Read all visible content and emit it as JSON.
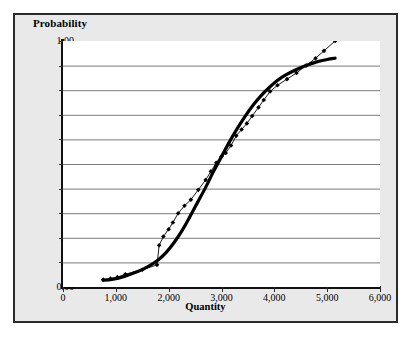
{
  "chart_data": {
    "type": "line",
    "title": "",
    "xlabel": "Quantity",
    "ylabel": "Probability",
    "xlim": [
      0,
      6000
    ],
    "ylim": [
      0.0,
      1.0
    ],
    "grid": true,
    "legend": "none",
    "xticks": [
      0,
      1000,
      2000,
      3000,
      4000,
      5000,
      6000
    ],
    "xtick_labels": [
      "0",
      "1,000",
      "2,000",
      "3,000",
      "4,000",
      "5,000",
      "6,000"
    ],
    "yticks": [
      0.0,
      0.1,
      0.2,
      0.3,
      0.4,
      0.5,
      0.6,
      0.7,
      0.8,
      0.9,
      1.0
    ],
    "ytick_labels": [
      "0.00",
      ".10",
      ".20",
      ".30",
      ".40",
      ".50",
      ".60",
      ".70",
      ".80",
      ".90",
      "1.00"
    ],
    "series": [
      {
        "name": "observed",
        "style": "thin-line-with-diamond-markers",
        "color": "#000000",
        "marker": "diamond",
        "points": [
          [
            760,
            0.03
          ],
          [
            900,
            0.034
          ],
          [
            1030,
            0.04
          ],
          [
            1180,
            0.052
          ],
          [
            1500,
            0.07
          ],
          [
            1780,
            0.09
          ],
          [
            1820,
            0.17
          ],
          [
            1900,
            0.205
          ],
          [
            2000,
            0.235
          ],
          [
            2080,
            0.262
          ],
          [
            2180,
            0.3
          ],
          [
            2300,
            0.33
          ],
          [
            2420,
            0.355
          ],
          [
            2560,
            0.395
          ],
          [
            2700,
            0.435
          ],
          [
            2800,
            0.47
          ],
          [
            2900,
            0.505
          ],
          [
            3000,
            0.53
          ],
          [
            3080,
            0.545
          ],
          [
            3180,
            0.575
          ],
          [
            3280,
            0.615
          ],
          [
            3380,
            0.64
          ],
          [
            3480,
            0.665
          ],
          [
            3580,
            0.695
          ],
          [
            3700,
            0.73
          ],
          [
            3800,
            0.76
          ],
          [
            3920,
            0.795
          ],
          [
            4060,
            0.82
          ],
          [
            4240,
            0.845
          ],
          [
            4420,
            0.87
          ],
          [
            4600,
            0.9
          ],
          [
            4780,
            0.93
          ],
          [
            4940,
            0.96
          ],
          [
            5150,
            1.0
          ]
        ]
      },
      {
        "name": "fitted",
        "style": "thick-smooth-curve",
        "color": "#000000",
        "points": [
          [
            760,
            0.028
          ],
          [
            900,
            0.03
          ],
          [
            1050,
            0.036
          ],
          [
            1200,
            0.046
          ],
          [
            1400,
            0.062
          ],
          [
            1600,
            0.082
          ],
          [
            1800,
            0.11
          ],
          [
            1950,
            0.14
          ],
          [
            2100,
            0.18
          ],
          [
            2250,
            0.228
          ],
          [
            2400,
            0.285
          ],
          [
            2550,
            0.345
          ],
          [
            2700,
            0.405
          ],
          [
            2850,
            0.47
          ],
          [
            3000,
            0.53
          ],
          [
            3150,
            0.59
          ],
          [
            3300,
            0.645
          ],
          [
            3450,
            0.695
          ],
          [
            3600,
            0.74
          ],
          [
            3750,
            0.778
          ],
          [
            3900,
            0.81
          ],
          [
            4050,
            0.838
          ],
          [
            4200,
            0.86
          ],
          [
            4400,
            0.882
          ],
          [
            4600,
            0.9
          ],
          [
            4800,
            0.915
          ],
          [
            5000,
            0.925
          ],
          [
            5150,
            0.93
          ]
        ]
      }
    ]
  },
  "axes": {
    "y_title": "Probability",
    "x_title": "Quantity"
  }
}
